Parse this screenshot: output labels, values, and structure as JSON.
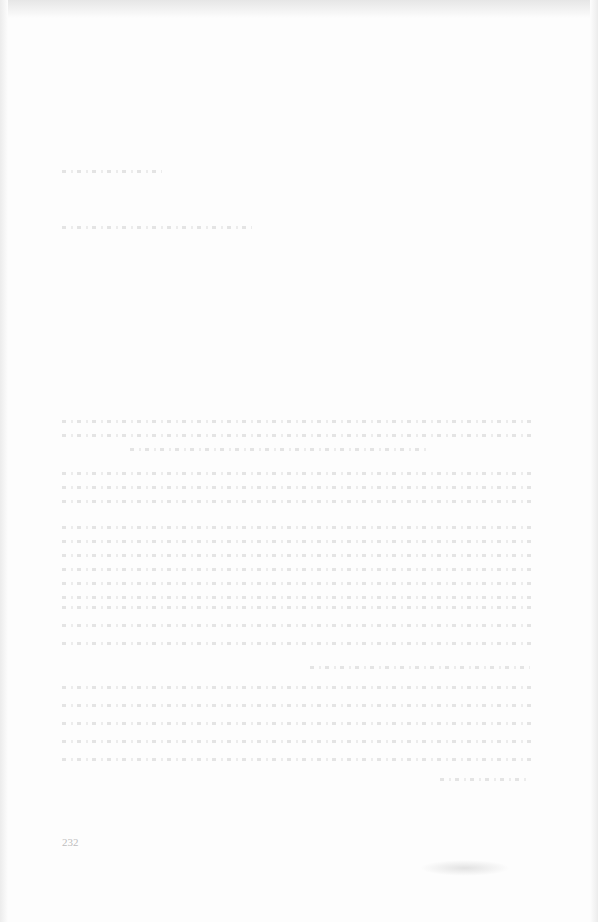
{
  "page": {
    "type": "faded scanned book page",
    "page_number": "232",
    "running_footer": "",
    "paragraphs": [
      {
        "top": 168,
        "lines": 1,
        "width": 100
      },
      {
        "top": 224,
        "lines": 1,
        "width": 190
      },
      {
        "top": 418,
        "lines": 3,
        "width": 470
      },
      {
        "top": 468,
        "lines": 3,
        "width": 470
      },
      {
        "top": 522,
        "lines": 6,
        "width": 470
      },
      {
        "top": 666,
        "lines": 6,
        "width": 470
      }
    ]
  }
}
